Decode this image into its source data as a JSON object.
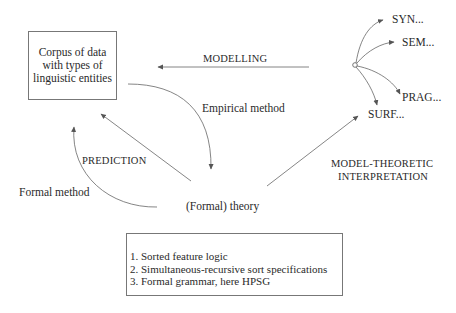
{
  "diagram": {
    "corpus_box": {
      "lines": [
        "Corpus of data",
        "with types of",
        "linguistic entities"
      ]
    },
    "theory_label": "(Formal) theory",
    "edges": {
      "modelling": "MODELLING",
      "empirical_method": "Empirical method",
      "prediction": "PREDICTION",
      "formal_method": "Formal method",
      "model_theoretic": [
        "MODEL-THEORETIC",
        "INTERPRETATION"
      ]
    },
    "model_branches": [
      "SYN...",
      "SEM...",
      "PRAG...",
      "SURF..."
    ],
    "theory_components": [
      "1. Sorted feature logic",
      "2. Simultaneous-recursive sort specifications",
      "3. Formal grammar, here HPSG"
    ],
    "colors": {
      "line": "#555555",
      "text": "#2a2a2a"
    }
  }
}
